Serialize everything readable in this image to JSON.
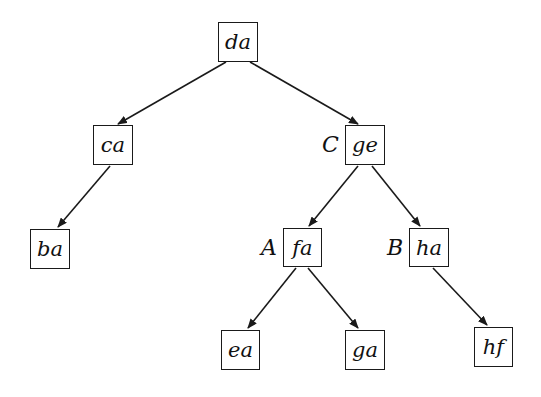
{
  "diagram": {
    "type": "tree",
    "nodes": [
      {
        "id": "da",
        "label": "da",
        "x": 218,
        "y": 22,
        "w": 40,
        "h": 40
      },
      {
        "id": "ca",
        "label": "ca",
        "x": 93,
        "y": 125,
        "w": 40,
        "h": 40
      },
      {
        "id": "ge",
        "label": "ge",
        "x": 345,
        "y": 125,
        "w": 40,
        "h": 40,
        "tag": "C"
      },
      {
        "id": "ba",
        "label": "ba",
        "x": 30,
        "y": 229,
        "w": 40,
        "h": 40
      },
      {
        "id": "fa",
        "label": "fa",
        "x": 283,
        "y": 228,
        "w": 39,
        "h": 39,
        "tag": "A"
      },
      {
        "id": "ha",
        "label": "ha",
        "x": 409,
        "y": 228,
        "w": 40,
        "h": 39,
        "tag": "B"
      },
      {
        "id": "ea",
        "label": "ea",
        "x": 221,
        "y": 330,
        "w": 39,
        "h": 40
      },
      {
        "id": "ga",
        "label": "ga",
        "x": 345,
        "y": 330,
        "w": 40,
        "h": 40
      },
      {
        "id": "hf",
        "label": "hf",
        "x": 474,
        "y": 327,
        "w": 39,
        "h": 40
      }
    ],
    "edges": [
      {
        "from": "da",
        "to": "ca"
      },
      {
        "from": "da",
        "to": "ge"
      },
      {
        "from": "ca",
        "to": "ba"
      },
      {
        "from": "ge",
        "to": "fa"
      },
      {
        "from": "ge",
        "to": "ha"
      },
      {
        "from": "fa",
        "to": "ea"
      },
      {
        "from": "fa",
        "to": "ga"
      },
      {
        "from": "ha",
        "to": "hf"
      }
    ],
    "tags": {
      "ge": "C",
      "fa": "A",
      "ha": "B"
    }
  }
}
